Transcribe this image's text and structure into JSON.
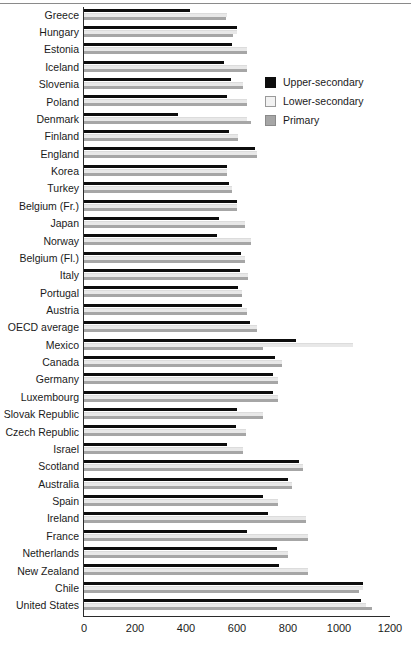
{
  "chart_data": {
    "type": "bar",
    "orientation": "horizontal",
    "title": "",
    "xlabel": "",
    "ylabel": "",
    "xlim": [
      0,
      1200
    ],
    "xticks": [
      0,
      200,
      400,
      600,
      800,
      1000,
      1200
    ],
    "grid": false,
    "legend_position": "upper-right-inside",
    "categories": [
      "Greece",
      "Hungary",
      "Estonia",
      "Iceland",
      "Slovenia",
      "Poland",
      "Denmark",
      "Finland",
      "England",
      "Korea",
      "Turkey",
      "Belgium (Fr.)",
      "Japan",
      "Norway",
      "Belgium (Fl.)",
      "Italy",
      "Portugal",
      "Austria",
      "OECD average",
      "Mexico",
      "Canada",
      "Germany",
      "Luxembourg",
      "Slovak Republic",
      "Czech Republic",
      "Israel",
      "Scotland",
      "Australia",
      "Spain",
      "Ireland",
      "France",
      "Netherlands",
      "New Zealand",
      "Chile",
      "United States"
    ],
    "series": [
      {
        "name": "Upper-secondary",
        "color": "#0d0d0d",
        "values": [
          415,
          600,
          580,
          550,
          575,
          560,
          370,
          570,
          670,
          560,
          570,
          600,
          530,
          520,
          615,
          610,
          605,
          620,
          650,
          830,
          750,
          740,
          740,
          600,
          595,
          560,
          845,
          800,
          700,
          720,
          640,
          755,
          765,
          1095,
          1085
        ]
      },
      {
        "name": "Lower-secondary",
        "color": "#e8e8e8",
        "values": [
          560,
          600,
          640,
          640,
          625,
          640,
          640,
          605,
          680,
          560,
          580,
          600,
          630,
          655,
          630,
          645,
          620,
          640,
          680,
          1055,
          775,
          760,
          760,
          700,
          635,
          625,
          860,
          815,
          760,
          870,
          880,
          800,
          880,
          1095,
          1105
        ]
      },
      {
        "name": "Primary",
        "color": "#a6a6a6",
        "values": [
          555,
          585,
          640,
          640,
          625,
          640,
          655,
          605,
          680,
          560,
          580,
          600,
          630,
          655,
          630,
          645,
          620,
          640,
          680,
          700,
          775,
          760,
          760,
          700,
          635,
          625,
          860,
          815,
          760,
          870,
          880,
          800,
          880,
          1080,
          1130
        ]
      }
    ]
  },
  "legend": {
    "items": [
      {
        "label": "Upper-secondary",
        "swatch": "s-upper"
      },
      {
        "label": "Lower-secondary",
        "swatch": "s-lower"
      },
      {
        "label": "Primary",
        "swatch": "s-primary"
      }
    ]
  }
}
